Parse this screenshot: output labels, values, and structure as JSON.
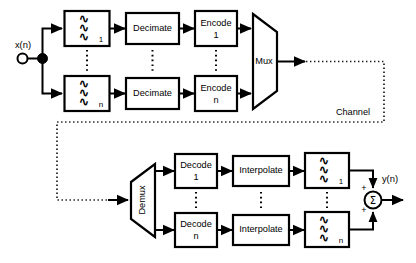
{
  "diagram": {
    "background_color": "#ffffff",
    "line_color": "#000000"
  },
  "io": {
    "input_label": "x(n)",
    "output_label": "y(n)"
  },
  "channel": {
    "label": "Channel"
  },
  "analysis": {
    "filter_top": {
      "glyph": "∿",
      "subscript": "1"
    },
    "filter_bottom": {
      "glyph": "∿",
      "subscript": "n"
    },
    "decimate_top": {
      "line1": "Decimate"
    },
    "decimate_bottom": {
      "line1": "Decimate"
    },
    "encode_top": {
      "line1": "Encode",
      "line2": "1"
    },
    "encode_bottom": {
      "line1": "Encode",
      "line2": "n"
    },
    "mux": {
      "label": "Mux"
    }
  },
  "synthesis": {
    "demux": {
      "label": "Demux"
    },
    "decode_top": {
      "line1": "Decode",
      "line2": "1"
    },
    "decode_bottom": {
      "line1": "Decode",
      "line2": "n"
    },
    "interpolate_top": {
      "line1": "Interpolate"
    },
    "interpolate_bottom": {
      "line1": "Interpolate"
    },
    "filter_top": {
      "glyph": "∿",
      "subscript": "1"
    },
    "filter_bottom": {
      "glyph": "∿",
      "subscript": "n"
    },
    "summer": {
      "symbol": "Σ",
      "sign_top": "+",
      "sign_bottom": "+"
    }
  },
  "icons": {
    "input_terminal": "open-circle-terminal-icon",
    "branch_node": "filled-junction-dot-icon",
    "arrow": "arrowhead-icon",
    "ellipsis_vertical": "vertical-dotted-ellipsis-icon"
  }
}
